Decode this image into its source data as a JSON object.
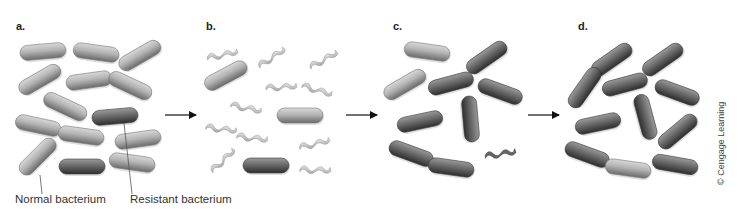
{
  "figure": {
    "panels": [
      {
        "id": "a",
        "label": "a.",
        "x": 16,
        "y": 25
      },
      {
        "id": "b",
        "label": "b.",
        "x": 206,
        "y": 25
      },
      {
        "id": "c",
        "label": "c.",
        "x": 392,
        "y": 25
      },
      {
        "id": "d",
        "label": "d.",
        "x": 578,
        "y": 25
      }
    ],
    "callouts": {
      "normal": "Normal bacterium",
      "resistant": "Resistant bacterium"
    },
    "credit": "© Cengage Learning",
    "colors": {
      "normal_fill": "#a8a8a8",
      "resistant_fill": "#555555",
      "dead_fill": "#cfcfcf",
      "arrow": "#111111",
      "leader_line": "#555555"
    },
    "bacteria": {
      "a": [
        {
          "cx": 43,
          "cy": 52,
          "rot": -5,
          "type": "normal"
        },
        {
          "cx": 96,
          "cy": 53,
          "rot": 8,
          "type": "normal"
        },
        {
          "cx": 140,
          "cy": 56,
          "rot": -30,
          "type": "normal"
        },
        {
          "cx": 40,
          "cy": 80,
          "rot": -30,
          "type": "normal"
        },
        {
          "cx": 89,
          "cy": 81,
          "rot": -8,
          "type": "normal"
        },
        {
          "cx": 130,
          "cy": 86,
          "rot": 25,
          "type": "normal"
        },
        {
          "cx": 65,
          "cy": 107,
          "rot": 25,
          "type": "normal"
        },
        {
          "cx": 115,
          "cy": 117,
          "rot": -5,
          "type": "resistant"
        },
        {
          "cx": 38,
          "cy": 126,
          "rot": 12,
          "type": "normal"
        },
        {
          "cx": 81,
          "cy": 136,
          "rot": 8,
          "type": "normal"
        },
        {
          "cx": 138,
          "cy": 140,
          "rot": -8,
          "type": "normal"
        },
        {
          "cx": 38,
          "cy": 157,
          "rot": -45,
          "type": "normal"
        },
        {
          "cx": 82,
          "cy": 167,
          "rot": 0,
          "type": "resistant"
        },
        {
          "cx": 132,
          "cy": 163,
          "rot": 8,
          "type": "normal"
        }
      ],
      "b": [
        {
          "cx": 226,
          "cy": 76,
          "rot": -28,
          "type": "normal"
        },
        {
          "cx": 300,
          "cy": 116,
          "rot": 0,
          "type": "normal"
        },
        {
          "cx": 266,
          "cy": 166,
          "rot": 0,
          "type": "resistant"
        }
      ],
      "b_dead": [
        {
          "cx": 222,
          "cy": 54,
          "rot": -8
        },
        {
          "cx": 271,
          "cy": 57,
          "rot": -30
        },
        {
          "cx": 323,
          "cy": 59,
          "rot": -25
        },
        {
          "cx": 281,
          "cy": 86,
          "rot": 0
        },
        {
          "cx": 317,
          "cy": 89,
          "rot": 20
        },
        {
          "cx": 246,
          "cy": 107,
          "rot": 15
        },
        {
          "cx": 221,
          "cy": 128,
          "rot": 10
        },
        {
          "cx": 252,
          "cy": 137,
          "rot": 10
        },
        {
          "cx": 314,
          "cy": 143,
          "rot": -10
        },
        {
          "cx": 222,
          "cy": 160,
          "rot": -40
        },
        {
          "cx": 315,
          "cy": 169,
          "rot": 5
        }
      ],
      "c": [
        {
          "cx": 427,
          "cy": 52,
          "rot": 8,
          "type": "normal"
        },
        {
          "cx": 487,
          "cy": 58,
          "rot": -35,
          "type": "resistant"
        },
        {
          "cx": 405,
          "cy": 85,
          "rot": -30,
          "type": "normal"
        },
        {
          "cx": 451,
          "cy": 84,
          "rot": -15,
          "type": "resistant"
        },
        {
          "cx": 500,
          "cy": 92,
          "rot": 20,
          "type": "resistant"
        },
        {
          "cx": 420,
          "cy": 122,
          "rot": -12,
          "type": "resistant"
        },
        {
          "cx": 470,
          "cy": 119,
          "rot": 85,
          "type": "resistant"
        },
        {
          "cx": 411,
          "cy": 154,
          "rot": 20,
          "type": "resistant"
        },
        {
          "cx": 451,
          "cy": 168,
          "rot": 8,
          "type": "resistant"
        }
      ],
      "c_dead": [
        {
          "cx": 500,
          "cy": 153,
          "rot": -5
        }
      ],
      "d": [
        {
          "cx": 612,
          "cy": 60,
          "rot": -35,
          "type": "resistant"
        },
        {
          "cx": 663,
          "cy": 60,
          "rot": -35,
          "type": "resistant"
        },
        {
          "cx": 585,
          "cy": 88,
          "rot": -55,
          "type": "resistant"
        },
        {
          "cx": 625,
          "cy": 85,
          "rot": -15,
          "type": "resistant"
        },
        {
          "cx": 677,
          "cy": 93,
          "rot": 20,
          "type": "resistant"
        },
        {
          "cx": 645,
          "cy": 117,
          "rot": 75,
          "type": "resistant"
        },
        {
          "cx": 598,
          "cy": 124,
          "rot": -12,
          "type": "resistant"
        },
        {
          "cx": 678,
          "cy": 132,
          "rot": -40,
          "type": "resistant"
        },
        {
          "cx": 587,
          "cy": 155,
          "rot": 20,
          "type": "resistant"
        },
        {
          "cx": 628,
          "cy": 169,
          "rot": 8,
          "type": "normal"
        },
        {
          "cx": 675,
          "cy": 165,
          "rot": 10,
          "type": "resistant"
        }
      ]
    },
    "arrows": [
      {
        "x1": 165,
        "x2": 196,
        "y": 115
      },
      {
        "x1": 346,
        "x2": 377,
        "y": 115
      },
      {
        "x1": 528,
        "x2": 559,
        "y": 115
      }
    ]
  }
}
